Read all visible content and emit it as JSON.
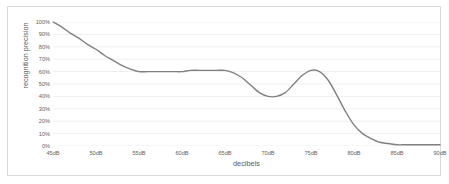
{
  "chart_data": {
    "type": "line",
    "title": "",
    "xlabel": "decibels",
    "ylabel": "recognition precision",
    "xlim": [
      45,
      90
    ],
    "ylim": [
      0,
      100
    ],
    "grid": true,
    "legend": false,
    "x_tick_labels": [
      "45dB",
      "50dB",
      "55dB",
      "60dB",
      "65dB",
      "70dB",
      "75dB",
      "80dB",
      "85dB",
      "90dB"
    ],
    "x_ticks": [
      45,
      50,
      55,
      60,
      65,
      70,
      75,
      80,
      85,
      90
    ],
    "y_tick_labels": [
      "100%",
      "90%",
      "80%",
      "70%",
      "60%",
      "50%",
      "40%",
      "30%",
      "20%",
      "10%",
      "0%"
    ],
    "y_ticks": [
      100,
      90,
      80,
      70,
      60,
      50,
      40,
      30,
      20,
      10,
      0
    ],
    "series": [
      {
        "name": "recognition precision",
        "color": "#808080",
        "x": [
          45,
          46,
          47,
          48,
          49,
          50,
          51,
          52,
          53,
          54,
          55,
          56,
          57,
          58,
          59,
          60,
          61,
          62,
          63,
          64,
          65,
          66,
          67,
          68,
          69,
          70,
          71,
          72,
          73,
          74,
          75,
          76,
          77,
          78,
          79,
          80,
          81,
          82,
          83,
          84,
          85,
          86,
          87,
          88,
          89,
          90
        ],
        "values": [
          100,
          96,
          91,
          87,
          82,
          78,
          73,
          69,
          65,
          62,
          60,
          60,
          60,
          60,
          60,
          60,
          61,
          61,
          61,
          61,
          61,
          59,
          55,
          49,
          43,
          40,
          40,
          43,
          50,
          57,
          61,
          60,
          53,
          41,
          28,
          17,
          10,
          6,
          3,
          2,
          1,
          1,
          1,
          1,
          1,
          1
        ]
      }
    ]
  },
  "colors": {
    "line": "#808080",
    "grid": "#efefef",
    "border": "#d9d9d9",
    "tick_text": "#616161",
    "axis_title_text": "#595959",
    "plot_background": "#ffffff"
  }
}
